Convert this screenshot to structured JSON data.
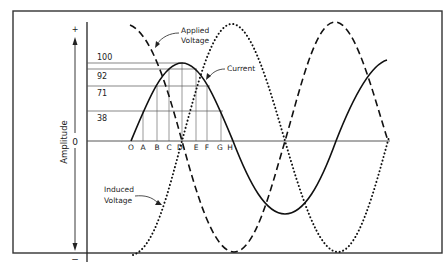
{
  "diagram": {
    "y_axis": {
      "title": "Amplitude",
      "plus_label": "+",
      "minus_label": "−",
      "zero_label": "0"
    },
    "amplitude_levels": [
      {
        "label": "100",
        "y": 63
      },
      {
        "label": "92",
        "y": 69
      },
      {
        "label": "71",
        "y": 86
      },
      {
        "label": "38",
        "y": 111
      }
    ],
    "time_points": [
      {
        "label": "O",
        "x": 131
      },
      {
        "label": "A",
        "x": 143
      },
      {
        "label": "B",
        "x": 157
      },
      {
        "label": "C",
        "x": 169
      },
      {
        "label": "D",
        "x": 182
      },
      {
        "label": "E",
        "x": 196
      },
      {
        "label": "F",
        "x": 207
      },
      {
        "label": "G",
        "x": 221
      },
      {
        "label": "H",
        "x": 231
      }
    ],
    "curves": {
      "current_label": "Current",
      "applied_label_line1": "Applied",
      "applied_label_line2": "Voltage",
      "induced_label_line1": "Induced",
      "induced_label_line2": "Voltage"
    }
  }
}
